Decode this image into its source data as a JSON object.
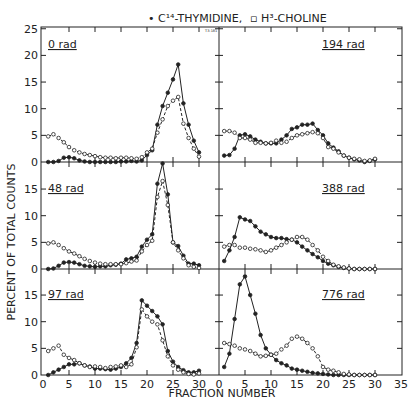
{
  "legend": {
    "thymidine_label": "• C¹⁴-THYMIDINE,",
    "choline_label": "▫ H³-CHOLINE"
  },
  "annotation": "T3-181",
  "ylabel": "PERCENT OF TOTAL COUNTS",
  "xlabel": "FRACTION NUMBER",
  "colors": {
    "ink": "#222222",
    "bg": "#ffffff"
  },
  "chart_data": [
    {
      "type": "line",
      "title": "0 rad",
      "panel": "top-left",
      "xlim": [
        0,
        30
      ],
      "ylim": [
        0,
        25
      ],
      "series": [
        {
          "name": "C14-Thymidine",
          "marker": "filled",
          "x": [
            1,
            2,
            3,
            4,
            5,
            6,
            7,
            8,
            9,
            10,
            11,
            12,
            13,
            14,
            15,
            16,
            17,
            18,
            19,
            20,
            21,
            22,
            23,
            24,
            25,
            26,
            27,
            28,
            29,
            30
          ],
          "values": [
            0,
            0,
            0.2,
            0.8,
            0.9,
            0.7,
            0.3,
            0.1,
            0,
            0,
            0,
            0,
            0,
            0,
            0.1,
            0.1,
            0.2,
            0.1,
            0.3,
            1.3,
            2.2,
            7,
            10.5,
            13,
            15.5,
            18.3,
            11,
            7,
            4,
            1.8
          ]
        },
        {
          "name": "H3-Choline",
          "marker": "open",
          "x": [
            1,
            2,
            3,
            4,
            5,
            6,
            7,
            8,
            9,
            10,
            11,
            12,
            13,
            14,
            15,
            16,
            17,
            18,
            19,
            20,
            21,
            22,
            23,
            24,
            25,
            26,
            27,
            28,
            29,
            30
          ],
          "values": [
            4.8,
            5.2,
            4.5,
            3.7,
            2.8,
            2.2,
            1.8,
            1.5,
            1.3,
            1.1,
            0.9,
            0.8,
            0.8,
            0.7,
            0.8,
            0.8,
            0.7,
            0.6,
            0.9,
            1.8,
            2.5,
            5.5,
            8,
            10.5,
            11.5,
            12.2,
            7.2,
            4.5,
            2.5,
            1
          ]
        }
      ]
    },
    {
      "type": "line",
      "title": "194 rad",
      "panel": "top-right",
      "xlim": [
        0,
        35
      ],
      "ylim": [
        0,
        25
      ],
      "series": [
        {
          "name": "C14-Thymidine",
          "marker": "filled",
          "x": [
            1,
            2,
            3,
            4,
            5,
            6,
            7,
            8,
            9,
            10,
            11,
            12,
            13,
            14,
            15,
            16,
            17,
            18,
            19,
            20,
            21,
            22,
            23,
            24,
            25,
            26,
            27,
            28,
            29,
            30
          ],
          "values": [
            1.2,
            1.3,
            2.5,
            5,
            5.2,
            4.8,
            4.2,
            3.8,
            3.5,
            3.5,
            3.5,
            4.2,
            5,
            6.2,
            6.5,
            7,
            7,
            7.2,
            6,
            5,
            3.5,
            2.7,
            2,
            1.2,
            0.8,
            0.5,
            0.3,
            0,
            0.2,
            0.5
          ]
        },
        {
          "name": "H3-Choline",
          "marker": "open",
          "x": [
            1,
            2,
            3,
            4,
            5,
            6,
            7,
            8,
            9,
            10,
            11,
            12,
            13,
            14,
            15,
            16,
            17,
            18,
            19,
            20,
            21,
            22,
            23,
            24,
            25,
            26,
            27,
            28,
            29,
            30
          ],
          "values": [
            5.8,
            5.8,
            5.5,
            4.5,
            4.5,
            4.2,
            3.6,
            3.6,
            3.5,
            3.6,
            4,
            3.6,
            3.8,
            4.5,
            5,
            5.2,
            5.4,
            5.6,
            5.4,
            4.5,
            2.8,
            2.5,
            1.8,
            1.2,
            0.8,
            0.6,
            0.5,
            0.2,
            0.3,
            0.6
          ]
        }
      ]
    },
    {
      "type": "line",
      "title": "48 rad",
      "panel": "middle-left",
      "xlim": [
        0,
        30
      ],
      "ylim": [
        0,
        20
      ],
      "series": [
        {
          "name": "C14-Thymidine",
          "marker": "filled",
          "x": [
            1,
            2,
            3,
            4,
            5,
            6,
            7,
            8,
            9,
            10,
            11,
            12,
            13,
            14,
            15,
            16,
            17,
            18,
            19,
            20,
            21,
            22,
            23,
            24,
            25,
            26,
            27,
            28,
            29,
            30
          ],
          "values": [
            0,
            0.1,
            0.6,
            1.2,
            1.3,
            1.2,
            0.9,
            0.6,
            0.5,
            0.4,
            0.5,
            0.5,
            0.7,
            0.8,
            1,
            1.8,
            2,
            2.3,
            4.2,
            5.5,
            6.5,
            16,
            19.8,
            14,
            5,
            4.3,
            2.5,
            1,
            1,
            0.7
          ]
        },
        {
          "name": "H3-Choline",
          "marker": "open",
          "x": [
            1,
            2,
            3,
            4,
            5,
            6,
            7,
            8,
            9,
            10,
            11,
            12,
            13,
            14,
            15,
            16,
            17,
            18,
            19,
            20,
            21,
            22,
            23,
            24,
            25,
            26,
            27,
            28,
            29,
            30
          ],
          "values": [
            4.8,
            5,
            4.5,
            3.9,
            3.3,
            2.9,
            2.4,
            1.9,
            1.5,
            1.2,
            1,
            0.9,
            0.9,
            0.9,
            0.9,
            1.1,
            1.4,
            1.6,
            3.3,
            4.5,
            5.3,
            13.5,
            16.5,
            12,
            5,
            3.5,
            2,
            0.7,
            0.4,
            0.2
          ]
        }
      ]
    },
    {
      "type": "line",
      "title": "388 rad",
      "panel": "middle-right",
      "xlim": [
        0,
        35
      ],
      "ylim": [
        0,
        20
      ],
      "series": [
        {
          "name": "C14-Thymidine",
          "marker": "filled",
          "x": [
            1,
            2,
            3,
            4,
            5,
            6,
            7,
            8,
            9,
            10,
            11,
            12,
            13,
            14,
            15,
            16,
            17,
            18,
            19,
            20,
            21,
            22,
            23,
            24,
            25,
            26,
            27,
            28,
            29,
            30
          ],
          "values": [
            1.5,
            3.5,
            6,
            9.7,
            9.3,
            9,
            8,
            7,
            6.5,
            6,
            5.8,
            5.8,
            5.6,
            5.5,
            5,
            4.2,
            3.5,
            2.8,
            2.2,
            1.5,
            1,
            0.7,
            0.4,
            0.2,
            0.1,
            0,
            0,
            0,
            0,
            0
          ]
        },
        {
          "name": "H3-Choline",
          "marker": "open",
          "x": [
            1,
            2,
            3,
            4,
            5,
            6,
            7,
            8,
            9,
            10,
            11,
            12,
            13,
            14,
            15,
            16,
            17,
            18,
            19,
            20,
            21,
            22,
            23,
            24,
            25,
            26,
            27,
            28,
            29,
            30
          ],
          "values": [
            4.2,
            4.5,
            4.5,
            4,
            4,
            3.8,
            3.7,
            3.5,
            3.2,
            3.5,
            4,
            4.5,
            5,
            5.5,
            6,
            6,
            5.5,
            4.5,
            3.5,
            2.3,
            1.5,
            0.8,
            0.5,
            0.3,
            0.1,
            0,
            0,
            0,
            0,
            0
          ]
        }
      ]
    },
    {
      "type": "line",
      "title": "97 rad",
      "panel": "bottom-left",
      "xlim": [
        0,
        30
      ],
      "ylim": [
        0,
        20
      ],
      "series": [
        {
          "name": "C14-Thymidine",
          "marker": "filled",
          "x": [
            1,
            2,
            3,
            4,
            5,
            6,
            7,
            8,
            9,
            10,
            11,
            12,
            13,
            14,
            15,
            16,
            17,
            18,
            19,
            20,
            21,
            22,
            23,
            24,
            25,
            26,
            27,
            28,
            29,
            30
          ],
          "values": [
            0,
            0.5,
            1,
            1.5,
            2,
            2,
            2.2,
            1.8,
            1.6,
            1.2,
            1.2,
            1.1,
            1,
            1.2,
            1.5,
            2.2,
            3.2,
            6,
            14,
            13,
            12,
            11,
            9.5,
            4.5,
            2.5,
            1.5,
            0.9,
            0.5,
            0.5,
            0.8
          ]
        },
        {
          "name": "H3-Choline",
          "marker": "open",
          "x": [
            1,
            2,
            3,
            4,
            5,
            6,
            7,
            8,
            9,
            10,
            11,
            12,
            13,
            14,
            15,
            16,
            17,
            18,
            19,
            20,
            21,
            22,
            23,
            24,
            25,
            26,
            27,
            28,
            29,
            30
          ],
          "values": [
            4.5,
            5,
            5.5,
            3.8,
            3.2,
            2.8,
            2.2,
            1.8,
            1.5,
            1.6,
            1.5,
            1.3,
            1.5,
            1.6,
            1.8,
            1.5,
            2,
            5.2,
            12.3,
            11,
            10,
            9.5,
            6.5,
            3.5,
            1.8,
            1,
            0.5,
            0.2,
            0.1,
            0.3
          ]
        }
      ]
    },
    {
      "type": "line",
      "title": "776 rad",
      "panel": "bottom-right",
      "xlim": [
        0,
        35
      ],
      "ylim": [
        0,
        20
      ],
      "series": [
        {
          "name": "C14-Thymidine",
          "marker": "filled",
          "x": [
            1,
            2,
            3,
            4,
            5,
            6,
            7,
            8,
            9,
            10,
            11,
            12,
            13,
            14,
            15,
            16,
            17,
            18,
            19,
            20,
            21,
            22,
            23,
            24,
            25,
            26,
            27,
            28,
            29,
            30
          ],
          "values": [
            1.5,
            4,
            10.5,
            17,
            18.5,
            15,
            11.5,
            7.5,
            5,
            3.8,
            2.8,
            2.2,
            1.8,
            1.2,
            1,
            0.8,
            0.6,
            0.4,
            0.3,
            0.2,
            0.1,
            0,
            0,
            0,
            0,
            0,
            0,
            0,
            0,
            0
          ]
        },
        {
          "name": "H3-Choline",
          "marker": "open",
          "x": [
            1,
            2,
            3,
            4,
            5,
            6,
            7,
            8,
            9,
            10,
            11,
            12,
            13,
            14,
            15,
            16,
            17,
            18,
            19,
            20,
            21,
            22,
            23,
            24,
            25,
            26,
            27,
            28,
            29,
            30
          ],
          "values": [
            6,
            5.8,
            5.5,
            5,
            4.8,
            4.5,
            4,
            3.5,
            3.6,
            3.8,
            4,
            4.8,
            5.5,
            6.8,
            7.2,
            6.8,
            6,
            5,
            3.5,
            1.5,
            1,
            0.8,
            0.5,
            0.2,
            0.1,
            0,
            0,
            0,
            0,
            0
          ]
        }
      ]
    }
  ],
  "axes": {
    "x_ticks_left": [
      "0",
      "5",
      "10",
      "15",
      "20",
      "25",
      "30"
    ],
    "x_ticks_right": [
      "0",
      "5",
      "10",
      "15",
      "20",
      "25",
      "30",
      "35"
    ],
    "y_ticks_top": [
      "0",
      "5",
      "10",
      "15",
      "20",
      "25"
    ],
    "y_ticks_lower": [
      "0",
      "5",
      "10",
      "15"
    ]
  }
}
